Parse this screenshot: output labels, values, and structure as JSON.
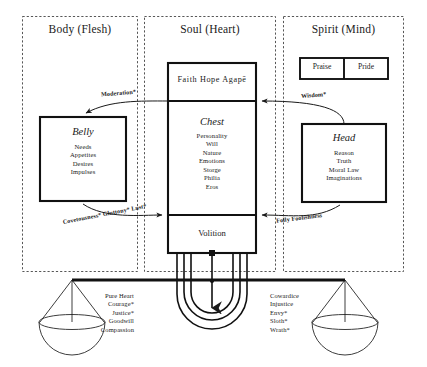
{
  "diagram": {
    "title_columns": [
      {
        "id": "body",
        "label": "Body (Flesh)"
      },
      {
        "id": "soul",
        "label": "Soul (Heart)"
      },
      {
        "id": "spirit",
        "label": "Spirit (Mind)"
      }
    ],
    "boxes": {
      "belly": {
        "title": "Belly",
        "items": [
          "Needs",
          "Appetites",
          "Desires",
          "Impulses"
        ]
      },
      "chest": {
        "title": "Chest",
        "items": [
          "Personality",
          "Will",
          "Nature",
          "Emotions",
          "Storge",
          "Philia",
          "Eros"
        ]
      },
      "head": {
        "title": "Head",
        "items": [
          "Reason",
          "Truth",
          "Moral Law",
          "Imaginations"
        ]
      },
      "virtues_top": {
        "label": "Faith  Hope  Agapē"
      },
      "volition": {
        "label": "Volition"
      },
      "praise": {
        "label": "Praise"
      },
      "pride": {
        "label": "Pride"
      }
    },
    "arrows": [
      {
        "id": "moderation",
        "label": "Moderation*"
      },
      {
        "id": "wisdom",
        "label": "Wisdom*"
      },
      {
        "id": "covetousness",
        "label": "Covetousness* Gluttony* Lust*"
      },
      {
        "id": "folly",
        "label": "Folly Foolishness"
      }
    ],
    "scales": {
      "left": {
        "items": [
          "Pure Heart",
          "Courage*",
          "Justice*",
          "Goodwill",
          "Compassion"
        ]
      },
      "right": {
        "items": [
          "Cowardice",
          "Injustice",
          "Envy*",
          "Sloth*",
          "Wrath*"
        ]
      }
    },
    "colors": {
      "ink": "#1a1a1a",
      "paper": "#ffffff",
      "rule": "#2b2b2b"
    }
  }
}
